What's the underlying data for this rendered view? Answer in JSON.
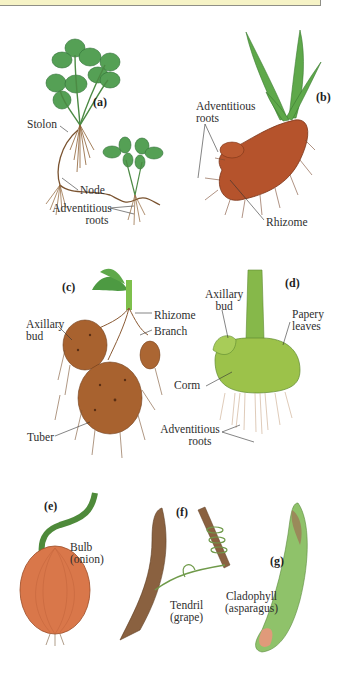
{
  "figure": {
    "banner": {
      "color": "#f6f3c6",
      "border": "#8f8f86"
    },
    "panels": [
      {
        "id": "a",
        "label": "(a)",
        "labels": [
          "Stolon",
          "Node",
          "Adventitious",
          "roots"
        ]
      },
      {
        "id": "b",
        "label": "(b)",
        "labels": [
          "Adventitious",
          "roots",
          "Rhizome"
        ]
      },
      {
        "id": "c",
        "label": "(c)",
        "labels": [
          "Axillary",
          "bud",
          "Rhizome",
          "Branch",
          "Tuber"
        ]
      },
      {
        "id": "d",
        "label": "(d)",
        "labels": [
          "Axillary",
          "bud",
          "Papery",
          "leaves",
          "Corm",
          "Adventitious",
          "roots"
        ]
      },
      {
        "id": "e",
        "label": "(e)",
        "labels": [
          "Bulb",
          "(onion)"
        ]
      },
      {
        "id": "f",
        "label": "(f)",
        "labels": [
          "Tendril",
          "(grape)"
        ]
      },
      {
        "id": "g",
        "label": "(g)",
        "labels": [
          "Cladophyll",
          "(asparagus)"
        ]
      }
    ],
    "colors": {
      "leaf": "#4f9a52",
      "root": "#9a6a3c",
      "rhizome": "#b5532c",
      "potato": "#a8622f",
      "corm": "#9cc24a",
      "onion": "#d9774a",
      "vine": "#8a6140",
      "asparagus": "#8fc26a",
      "text": "#2e2e2e"
    }
  }
}
